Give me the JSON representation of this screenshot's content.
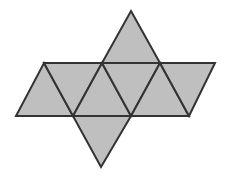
{
  "figure": {
    "name": "polyhedron-net",
    "width": 228,
    "height": 183,
    "background_color": "#FFFFFF",
    "fill_color": "#BFBFBF",
    "stroke_color": "#333333",
    "stroke_width": 2.0,
    "geometry": {
      "side_length": 58,
      "triangle_height": 53,
      "top_row_y": 63,
      "bottom_row_y": 116,
      "top_apex": [
        131,
        11
      ],
      "bottom_apex": [
        101,
        167
      ],
      "top_line_x": [
        44,
        215
      ],
      "bottom_line_x": [
        16,
        196
      ]
    },
    "faces": [
      {
        "id": "face-top-up",
        "label": "top flap triangle",
        "orientation": "up",
        "points": "131,11 160,63 102,63"
      },
      {
        "id": "face-strip-1",
        "label": "strip triangle 1 pointing up",
        "orientation": "up",
        "points": "44,63 73,116 16,116"
      },
      {
        "id": "face-strip-2",
        "label": "strip triangle 2 pointing down",
        "orientation": "down",
        "points": "44,63 102,63 73,116"
      },
      {
        "id": "face-strip-3",
        "label": "strip triangle 3 pointing up",
        "orientation": "up",
        "points": "102,63 131,116 73,116"
      },
      {
        "id": "face-strip-4",
        "label": "strip triangle 4 pointing down",
        "orientation": "down",
        "points": "102,63 160,63 131,116"
      },
      {
        "id": "face-strip-5",
        "label": "strip triangle 5 pointing up",
        "orientation": "up",
        "points": "160,63 189,116 131,116"
      },
      {
        "id": "face-strip-6",
        "label": "strip triangle 6 pointing down",
        "orientation": "down",
        "points": "160,63 215,63 189,116"
      },
      {
        "id": "face-bottom-down",
        "label": "bottom flap triangle",
        "orientation": "down",
        "points": "73,116 131,116 101,167"
      }
    ]
  }
}
